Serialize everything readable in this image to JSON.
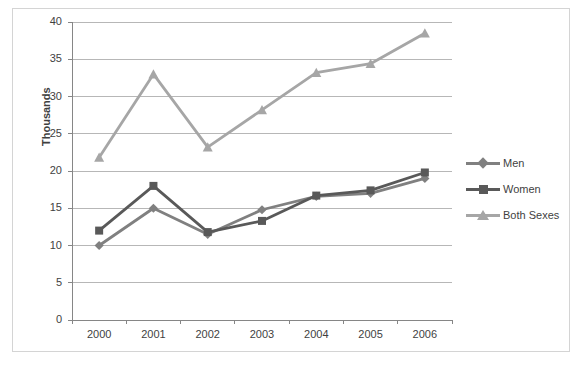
{
  "chart_data": {
    "type": "line",
    "title": "",
    "xlabel": "",
    "ylabel": "Thousands",
    "categories": [
      "2000",
      "2001",
      "2002",
      "2003",
      "2004",
      "2005",
      "2006"
    ],
    "ylim": [
      0,
      40
    ],
    "ytick_step": 5,
    "yticks": [
      "0",
      "5",
      "10",
      "15",
      "20",
      "25",
      "30",
      "35",
      "40"
    ],
    "grid": "horizontal",
    "legend_position": "right",
    "series": [
      {
        "name": "Men",
        "marker": "diamond",
        "color": "#808080",
        "values": [
          10.0,
          15.0,
          11.5,
          14.8,
          16.6,
          17.0,
          19.0
        ]
      },
      {
        "name": "Women",
        "marker": "square",
        "color": "#595959",
        "values": [
          12.0,
          18.0,
          11.8,
          13.3,
          16.7,
          17.4,
          19.8
        ]
      },
      {
        "name": "Both Sexes",
        "marker": "triangle",
        "color": "#a6a6a6",
        "values": [
          21.8,
          33.0,
          23.2,
          28.2,
          33.2,
          34.4,
          38.5
        ]
      }
    ]
  },
  "legend": {
    "items": [
      {
        "label": "Men"
      },
      {
        "label": "Women"
      },
      {
        "label": "Both Sexes"
      }
    ]
  },
  "colors": {
    "men": "#808080",
    "women": "#595959",
    "both_sexes": "#a6a6a6",
    "gridline": "#b7b7b7",
    "axis": "#868686",
    "text": "#3f3f3f",
    "border": "#d4d4d4",
    "background": "#ffffff"
  }
}
